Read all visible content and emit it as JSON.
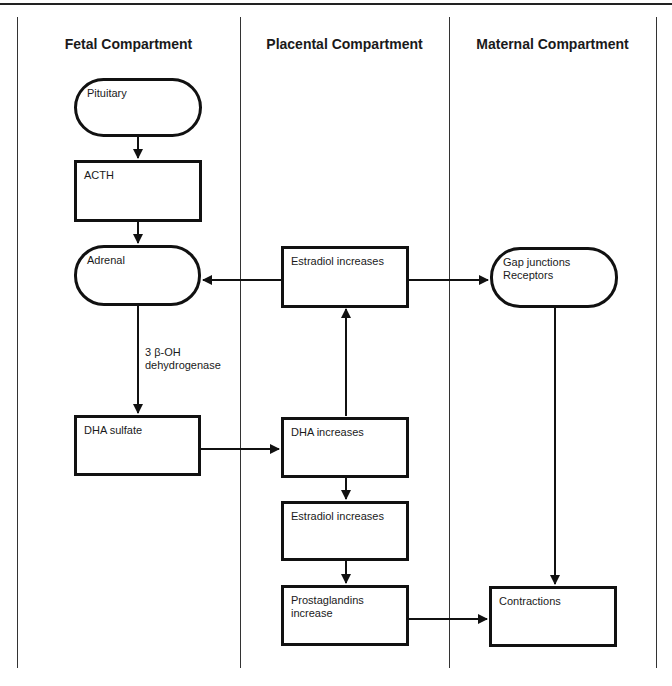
{
  "columns": [
    {
      "title": "Fetal Compartment"
    },
    {
      "title": "Placental Compartment"
    },
    {
      "title": "Maternal Compartment"
    }
  ],
  "nodes": {
    "pituitary": {
      "label": "Pituitary",
      "shape": "pill"
    },
    "acth": {
      "label": "ACTH",
      "shape": "rect"
    },
    "adrenal": {
      "label": "Adrenal",
      "shape": "pill"
    },
    "dha_sulfate": {
      "label": "DHA sulfate",
      "shape": "rect"
    },
    "estradiol_top": {
      "label": "Estradiol increases",
      "shape": "rect"
    },
    "dha_increases": {
      "label": "DHA increases",
      "shape": "rect"
    },
    "estradiol_mid": {
      "label": "Estradiol increases",
      "shape": "rect"
    },
    "prostaglandins": {
      "label": "Prostaglandins increase",
      "shape": "rect"
    },
    "gap_junctions": {
      "label_line1": "Gap junctions",
      "label_line2": "Receptors",
      "shape": "pill"
    },
    "contractions": {
      "label": "Contractions",
      "shape": "rect"
    }
  },
  "edges": [
    {
      "from": "pituitary",
      "to": "acth"
    },
    {
      "from": "acth",
      "to": "adrenal"
    },
    {
      "from": "adrenal",
      "to": "dha_sulfate",
      "label_line1": "3 β-OH",
      "label_line2": "dehydrogenase"
    },
    {
      "from": "dha_sulfate",
      "to": "dha_increases"
    },
    {
      "from": "dha_increases",
      "to": "estradiol_top"
    },
    {
      "from": "estradiol_top",
      "to": "adrenal"
    },
    {
      "from": "estradiol_top",
      "to": "gap_junctions"
    },
    {
      "from": "dha_increases",
      "to": "estradiol_mid"
    },
    {
      "from": "estradiol_mid",
      "to": "prostaglandins"
    },
    {
      "from": "gap_junctions",
      "to": "contractions"
    },
    {
      "from": "prostaglandins",
      "to": "contractions"
    }
  ],
  "edge_label": {
    "line1": "3 β-OH",
    "line2": "dehydrogenase"
  }
}
